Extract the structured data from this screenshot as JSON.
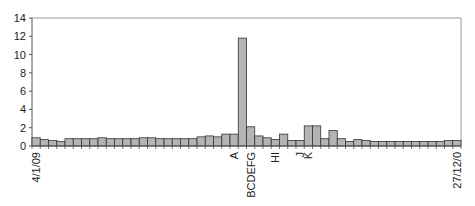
{
  "chart_data": {
    "type": "bar",
    "title": "",
    "xlabel": "",
    "ylabel": "",
    "ylim": [
      0,
      14
    ],
    "yticks": [
      0,
      2,
      4,
      6,
      8,
      10,
      12,
      14
    ],
    "grid": false,
    "legend": null,
    "bar_color": "#b4b4b4",
    "bar_edge_color": "#333333",
    "categories_count": 52,
    "values": [
      0.9,
      0.7,
      0.6,
      0.5,
      0.8,
      0.8,
      0.8,
      0.8,
      0.9,
      0.8,
      0.8,
      0.8,
      0.8,
      0.9,
      0.9,
      0.8,
      0.8,
      0.8,
      0.8,
      0.8,
      1.0,
      1.1,
      1.0,
      1.3,
      1.3,
      11.8,
      2.1,
      1.1,
      0.9,
      0.7,
      1.3,
      0.6,
      0.6,
      2.2,
      2.2,
      0.8,
      1.7,
      0.8,
      0.5,
      0.7,
      0.6,
      0.5,
      0.5,
      0.5,
      0.5,
      0.5,
      0.5,
      0.5,
      0.5,
      0.5,
      0.6,
      0.6
    ],
    "x_labels": [
      {
        "index": 0,
        "text": "4/1/09"
      },
      {
        "index": 24,
        "text": "A"
      },
      {
        "index": 26,
        "text": "BCDEFG"
      },
      {
        "index": 29,
        "text": "HI"
      },
      {
        "index": 32,
        "text": "J"
      },
      {
        "index": 33,
        "text": "K"
      },
      {
        "index": 51,
        "text": "27/12/0"
      }
    ]
  }
}
